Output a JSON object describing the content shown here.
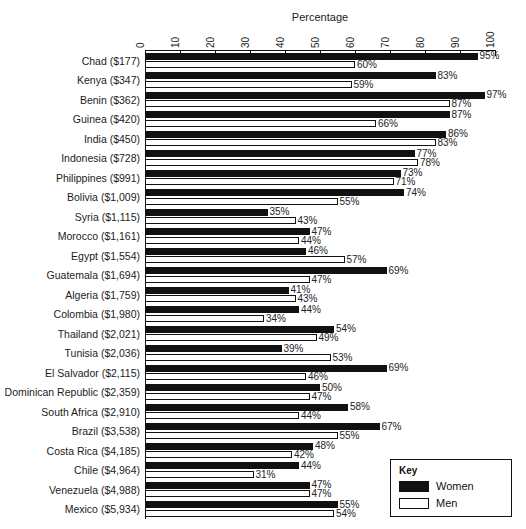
{
  "chart": {
    "type": "bar",
    "orientation": "horizontal",
    "axis_title": "Percentage"
  },
  "legend": {
    "title": "Key",
    "women_label": "Women",
    "men_label": "Men",
    "women_color": "#111111",
    "men_color": "#ffffff",
    "position": "bottom-right"
  },
  "chart_data": {
    "type": "bar",
    "title": "",
    "subtitle": "",
    "xlabel": "Percentage",
    "ylabel": "",
    "xlim": [
      0,
      100
    ],
    "xticks": [
      0,
      10,
      20,
      30,
      40,
      50,
      60,
      70,
      80,
      90,
      100
    ],
    "xtick_labels": [
      "0",
      "10",
      "20",
      "30",
      "40",
      "50",
      "60",
      "70",
      "80",
      "90",
      "100"
    ],
    "grid": false,
    "legend_position": "bottom-right",
    "orientation": "horizontal",
    "categories": [
      "Chad ($177)",
      "Kenya ($347)",
      "Benin ($362)",
      "Guinea ($420)",
      "India ($450)",
      "Indonesia ($728)",
      "Philippines ($991)",
      "Bolivia ($1,009)",
      "Syria ($1,115)",
      "Morocco ($1,161)",
      "Egypt ($1,554)",
      "Guatemala ($1,694)",
      "Algeria ($1,759)",
      "Colombia ($1,980)",
      "Thailand ($2,021)",
      "Tunisia ($2,036)",
      "El Salvador ($2,115)",
      "Dominican Republic ($2,359)",
      "South Africa ($2,910)",
      "Brazil ($3,538)",
      "Costa Rica ($4,185)",
      "Chile ($4,964)",
      "Venezuela ($4,988)",
      "Mexico ($5,934)"
    ],
    "series": [
      {
        "name": "Women",
        "color": "#111111",
        "values": [
          95,
          83,
          97,
          87,
          86,
          77,
          73,
          74,
          35,
          47,
          46,
          69,
          41,
          44,
          54,
          39,
          69,
          50,
          58,
          67,
          48,
          44,
          47,
          55
        ],
        "labels": [
          "95%",
          "83%",
          "97%",
          "87%",
          "86%",
          "77%",
          "73%",
          "74%",
          "35%",
          "47%",
          "46%",
          "69%",
          "41%",
          "44%",
          "54%",
          "39%",
          "69%",
          "50%",
          "58%",
          "67%",
          "48%",
          "44%",
          "47%",
          "55%"
        ]
      },
      {
        "name": "Men",
        "color": "#ffffff",
        "values": [
          60,
          59,
          87,
          66,
          83,
          78,
          71,
          55,
          43,
          44,
          57,
          47,
          43,
          34,
          49,
          53,
          46,
          47,
          44,
          55,
          42,
          31,
          47,
          54
        ],
        "labels": [
          "60%",
          "59%",
          "87%",
          "66%",
          "83%",
          "78%",
          "71%",
          "55%",
          "43%",
          "44%",
          "57%",
          "47%",
          "43%",
          "34%",
          "49%",
          "53%",
          "46%",
          "47%",
          "44%",
          "55%",
          "42%",
          "31%",
          "47%",
          "54%"
        ]
      }
    ]
  }
}
